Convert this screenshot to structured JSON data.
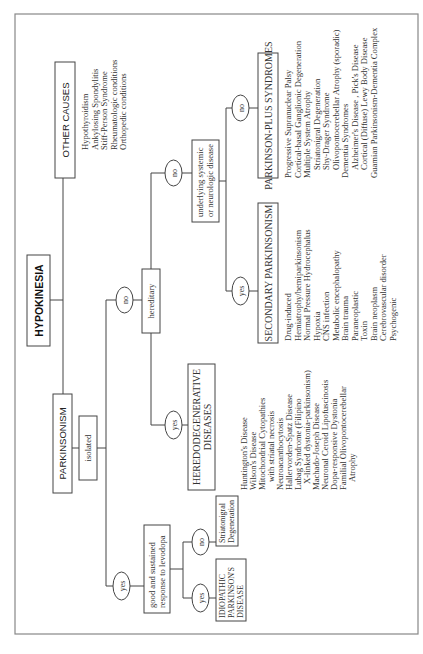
{
  "title": "HYPOKINESIA",
  "nodes": {
    "hypokinesia": "HYPOKINESIA",
    "other_causes": "OTHER CAUSES",
    "parkinsonism": "PARKINSONISM",
    "isolated": "isolated",
    "hereditary": "hereditary",
    "underlying_l1": "underlying systemic",
    "underlying_l2": "or neurologic disease",
    "good_response_l1": "good and sustained",
    "good_response_l2": "response to levodopa",
    "heredodegenerative_l1": "HEREDODEGENERATIVE",
    "heredodegenerative_l2": "DISEASES",
    "secondary_parkinsonism": "SECONDARY PARKINSONISM",
    "parkinson_plus": "PARKINSON-PLUS SYNDROMES",
    "idiopathic_l1": "IDIOPATHIC",
    "idiopathic_l2": "PARKINSON'S",
    "idiopathic_l3": "DISEASE",
    "striatonigral_l1": "Striatonigral",
    "striatonigral_l2": "Degeneration"
  },
  "edge_labels": {
    "hereditary_no": "no",
    "underlying_no": "no",
    "underlying_yes": "yes",
    "hereditary_yes": "yes",
    "isolated_yes": "yes",
    "levodopa_yes": "yes",
    "levodopa_no": "no"
  },
  "lists": {
    "other_causes": [
      "Hypothyroidism",
      "Ankylosing Spondylitis",
      "Stiff-Person Syndrome",
      "Rheumatologic conditions",
      "Orthopedic conditions"
    ],
    "heredodegenerative": [
      "Huntington's Disease",
      "Wilson's Disease",
      "Mitochondrial Cytopathies",
      "with striatal necrosis",
      "Neuroacanthocytosis",
      "Hallervorden-Spatz Disease",
      "Lubag Syndrome (Filipino",
      "X-linked dystonia-parkinsonism)",
      "Machado-Joseph Disease",
      "Neuronal Ceroid Lipofuscinosis",
      "Dopa-responsive Dystonia",
      "Familial Olivopontocerebellar",
      "Atrophy"
    ],
    "secondary": [
      "Drug-induced",
      "Hemiatrophy/hemiparkinsonism",
      "Normal Pressure Hydrocephalus",
      "Hypoxia",
      "CNS infection",
      "Metabolic encephalopathy",
      "Brain trauma",
      "Paraneoplastic",
      "Toxin",
      "Brain neoplasm",
      "Cerebrovascular disorder",
      "Psychogenic"
    ],
    "parkinson_plus": [
      "Progressive Supranuclear Palsy",
      "Cortical-basal Ganglionic Degeneration",
      "Multiple System Atrophy",
      "Striatonigral Degeneration",
      "Shy-Drager Syndrome",
      "Olivopontocerebellar Atrophy (sporadic)",
      "Dementia Syndromes",
      "Alzheimer's Disease , Pick's Disease",
      "Cortical (Diffuse) Lewy Body Disease",
      "Guamian Parkinsonism-Dementia Complex"
    ]
  }
}
